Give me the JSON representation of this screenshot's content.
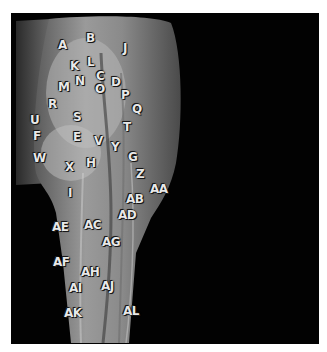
{
  "figure": {
    "colors": {
      "background": "#ffffff",
      "frame": "#020202",
      "label": "#e8e8e8"
    },
    "labels": [
      {
        "id": "A",
        "text": "A",
        "x": 63,
        "y": 45
      },
      {
        "id": "B",
        "text": "B",
        "x": 91,
        "y": 38
      },
      {
        "id": "J",
        "text": "J",
        "x": 128,
        "y": 48
      },
      {
        "id": "K",
        "text": "K",
        "x": 75,
        "y": 66
      },
      {
        "id": "L",
        "text": "L",
        "x": 92,
        "y": 62
      },
      {
        "id": "C",
        "text": "C",
        "x": 101,
        "y": 76
      },
      {
        "id": "N",
        "text": "N",
        "x": 80,
        "y": 81
      },
      {
        "id": "M",
        "text": "M",
        "x": 63,
        "y": 87
      },
      {
        "id": "D",
        "text": "D",
        "x": 116,
        "y": 82
      },
      {
        "id": "O",
        "text": "O",
        "x": 100,
        "y": 89
      },
      {
        "id": "P",
        "text": "P",
        "x": 126,
        "y": 95
      },
      {
        "id": "Q",
        "text": "Q",
        "x": 137,
        "y": 109
      },
      {
        "id": "R",
        "text": "R",
        "x": 53,
        "y": 104
      },
      {
        "id": "S",
        "text": "S",
        "x": 78,
        "y": 117
      },
      {
        "id": "U",
        "text": "U",
        "x": 35,
        "y": 120
      },
      {
        "id": "T",
        "text": "T",
        "x": 128,
        "y": 127
      },
      {
        "id": "F",
        "text": "F",
        "x": 38,
        "y": 136
      },
      {
        "id": "E",
        "text": "E",
        "x": 78,
        "y": 137
      },
      {
        "id": "V",
        "text": "V",
        "x": 99,
        "y": 141
      },
      {
        "id": "Y",
        "text": "Y",
        "x": 116,
        "y": 147
      },
      {
        "id": "W",
        "text": "W",
        "x": 38,
        "y": 158
      },
      {
        "id": "G",
        "text": "G",
        "x": 133,
        "y": 157
      },
      {
        "id": "X",
        "text": "X",
        "x": 70,
        "y": 167
      },
      {
        "id": "H",
        "text": "H",
        "x": 91,
        "y": 163
      },
      {
        "id": "Z",
        "text": "Z",
        "x": 141,
        "y": 174
      },
      {
        "id": "AA",
        "text": "AA",
        "x": 155,
        "y": 189
      },
      {
        "id": "I",
        "text": "I",
        "x": 73,
        "y": 193
      },
      {
        "id": "AB",
        "text": "AB",
        "x": 131,
        "y": 199
      },
      {
        "id": "AD",
        "text": "AD",
        "x": 123,
        "y": 215
      },
      {
        "id": "AE",
        "text": "AE",
        "x": 57,
        "y": 227
      },
      {
        "id": "AC",
        "text": "AC",
        "x": 89,
        "y": 225
      },
      {
        "id": "AG",
        "text": "AG",
        "x": 107,
        "y": 242
      },
      {
        "id": "AF",
        "text": "AF",
        "x": 58,
        "y": 262
      },
      {
        "id": "AH",
        "text": "AH",
        "x": 86,
        "y": 272
      },
      {
        "id": "AI",
        "text": "AI",
        "x": 74,
        "y": 288
      },
      {
        "id": "AJ",
        "text": "AJ",
        "x": 106,
        "y": 286
      },
      {
        "id": "AK",
        "text": "AK",
        "x": 69,
        "y": 313
      },
      {
        "id": "AL",
        "text": "AL",
        "x": 128,
        "y": 311
      }
    ]
  }
}
